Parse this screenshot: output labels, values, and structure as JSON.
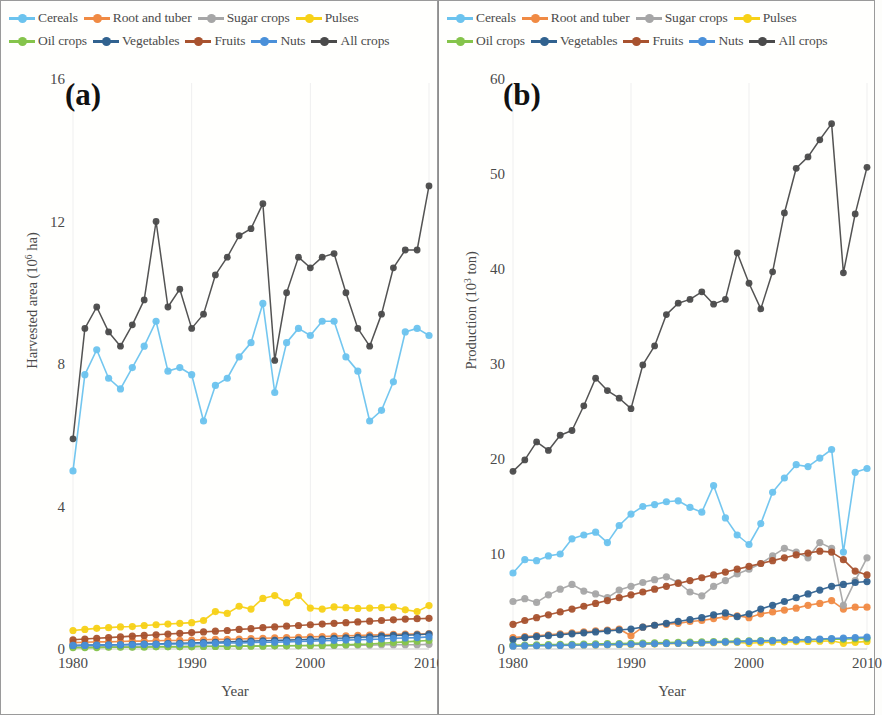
{
  "figure": {
    "panels": [
      {
        "id": "a",
        "letter": "(a)",
        "ylabel_main": "Harvested area (10",
        "ylabel_sup": "6",
        "ylabel_tail": " ha)",
        "xlabel": "Year"
      },
      {
        "id": "b",
        "letter": "(b)",
        "ylabel_main": "Production (10",
        "ylabel_sup": "3",
        "ylabel_tail": " ton)",
        "xlabel": "Year"
      }
    ]
  },
  "legend": {
    "row1": [
      {
        "label": "Cereals",
        "color": "#6cc3ee"
      },
      {
        "label": "Root and tuber",
        "color": "#f08a43"
      },
      {
        "label": "Sugar crops",
        "color": "#a6a6a6"
      },
      {
        "label": "Pulses",
        "color": "#f7d117"
      }
    ],
    "row2": [
      {
        "label": "Oil crops",
        "color": "#85c44b"
      },
      {
        "label": "Vegetables",
        "color": "#31628f"
      },
      {
        "label": "Fruits",
        "color": "#a8522e"
      },
      {
        "label": "Nuts",
        "color": "#4a90d9"
      },
      {
        "label": "All crops",
        "color": "#4a4a4a"
      }
    ]
  },
  "chart_data": [
    {
      "type": "line",
      "panel": "a",
      "title": "(a)",
      "xlabel": "Year",
      "ylabel": "Harvested area (10^6 ha)",
      "xlim": [
        1980,
        2010
      ],
      "ylim": [
        0,
        16
      ],
      "yticks": [
        0,
        4,
        8,
        12,
        16
      ],
      "xticks": [
        1980,
        1990,
        2000,
        2010
      ],
      "grid": false,
      "legend_position": "top",
      "x": [
        1980,
        1981,
        1982,
        1983,
        1984,
        1985,
        1986,
        1987,
        1988,
        1989,
        1990,
        1991,
        1992,
        1993,
        1994,
        1995,
        1996,
        1997,
        1998,
        1999,
        2000,
        2001,
        2002,
        2003,
        2004,
        2005,
        2006,
        2007,
        2008,
        2009,
        2010
      ],
      "series": [
        {
          "name": "Cereals",
          "color": "#6cc3ee",
          "values": [
            5.0,
            7.7,
            8.4,
            7.6,
            7.3,
            7.9,
            8.5,
            9.2,
            7.8,
            7.9,
            7.7,
            6.4,
            7.4,
            7.6,
            8.2,
            8.6,
            9.7,
            7.2,
            8.6,
            9.0,
            8.8,
            9.2,
            9.2,
            8.2,
            7.8,
            6.4,
            6.7,
            7.5,
            8.9,
            9.0,
            8.8,
            9.1,
            11.7,
            5.6,
            10.0,
            10.4
          ]
        },
        {
          "name": "Root and tuber",
          "color": "#f08a43",
          "values": [
            0.18,
            0.19,
            0.2,
            0.2,
            0.21,
            0.22,
            0.22,
            0.23,
            0.24,
            0.24,
            0.25,
            0.26,
            0.27,
            0.27,
            0.28,
            0.29,
            0.3,
            0.31,
            0.32,
            0.33,
            0.34,
            0.35,
            0.36,
            0.37,
            0.38,
            0.39,
            0.4,
            0.41,
            0.42,
            0.42,
            0.43
          ]
        },
        {
          "name": "Sugar crops",
          "color": "#a6a6a6",
          "values": [
            0.05,
            0.05,
            0.06,
            0.06,
            0.06,
            0.06,
            0.07,
            0.07,
            0.07,
            0.07,
            0.08,
            0.08,
            0.08,
            0.08,
            0.08,
            0.09,
            0.09,
            0.09,
            0.09,
            0.1,
            0.1,
            0.1,
            0.1,
            0.11,
            0.11,
            0.11,
            0.12,
            0.12,
            0.12,
            0.12,
            0.13
          ]
        },
        {
          "name": "Pulses",
          "color": "#f7d117",
          "values": [
            0.52,
            0.55,
            0.58,
            0.6,
            0.62,
            0.63,
            0.66,
            0.68,
            0.7,
            0.72,
            0.74,
            0.8,
            1.05,
            1.0,
            1.2,
            1.12,
            1.42,
            1.5,
            1.3,
            1.5,
            1.15,
            1.12,
            1.18,
            1.16,
            1.14,
            1.15,
            1.16,
            1.18,
            1.1,
            1.05,
            1.22
          ]
        },
        {
          "name": "Oil crops",
          "color": "#85c44b",
          "values": [
            0.04,
            0.04,
            0.04,
            0.05,
            0.05,
            0.05,
            0.05,
            0.06,
            0.06,
            0.06,
            0.06,
            0.07,
            0.07,
            0.07,
            0.08,
            0.08,
            0.08,
            0.09,
            0.09,
            0.09,
            0.1,
            0.1,
            0.11,
            0.12,
            0.13,
            0.14,
            0.16,
            0.18,
            0.2,
            0.22,
            0.24
          ]
        },
        {
          "name": "Vegetables",
          "color": "#31628f",
          "values": [
            0.1,
            0.11,
            0.11,
            0.12,
            0.12,
            0.13,
            0.14,
            0.14,
            0.15,
            0.16,
            0.17,
            0.18,
            0.19,
            0.2,
            0.21,
            0.22,
            0.23,
            0.24,
            0.25,
            0.26,
            0.27,
            0.28,
            0.3,
            0.31,
            0.33,
            0.34,
            0.36,
            0.38,
            0.39,
            0.4,
            0.42
          ]
        },
        {
          "name": "Fruits",
          "color": "#a8522e",
          "values": [
            0.26,
            0.28,
            0.3,
            0.32,
            0.34,
            0.36,
            0.38,
            0.4,
            0.42,
            0.44,
            0.46,
            0.48,
            0.5,
            0.52,
            0.55,
            0.57,
            0.6,
            0.62,
            0.64,
            0.66,
            0.68,
            0.7,
            0.72,
            0.74,
            0.76,
            0.78,
            0.8,
            0.82,
            0.84,
            0.85,
            0.86
          ]
        },
        {
          "name": "Nuts",
          "color": "#4a90d9",
          "values": [
            0.1,
            0.1,
            0.11,
            0.11,
            0.12,
            0.12,
            0.13,
            0.13,
            0.14,
            0.14,
            0.15,
            0.15,
            0.16,
            0.17,
            0.17,
            0.18,
            0.19,
            0.19,
            0.2,
            0.21,
            0.22,
            0.23,
            0.24,
            0.25,
            0.26,
            0.27,
            0.28,
            0.3,
            0.31,
            0.32,
            0.34
          ]
        },
        {
          "name": "All crops",
          "color": "#4a4a4a",
          "values": [
            5.9,
            9.0,
            9.6,
            8.9,
            8.5,
            9.1,
            9.8,
            12.0,
            9.6,
            10.1,
            9.0,
            9.4,
            10.5,
            11.0,
            11.6,
            11.8,
            12.5,
            8.1,
            10.0,
            11.0,
            10.7,
            11.0,
            11.1,
            10.0,
            9.0,
            8.5,
            9.4,
            10.7,
            11.2,
            11.2,
            13.0,
            13.7,
            14.8,
            8.8,
            13.2,
            13.7
          ]
        }
      ]
    },
    {
      "type": "line",
      "panel": "b",
      "title": "(b)",
      "xlabel": "Year",
      "ylabel": "Production (10^3 ton)",
      "xlim": [
        1980,
        2010
      ],
      "ylim": [
        0,
        60
      ],
      "yticks": [
        0,
        10,
        20,
        30,
        40,
        50,
        60
      ],
      "xticks": [
        1980,
        1990,
        2000,
        2010
      ],
      "grid": false,
      "legend_position": "top",
      "x": [
        1980,
        1981,
        1982,
        1983,
        1984,
        1985,
        1986,
        1987,
        1988,
        1989,
        1990,
        1991,
        1992,
        1993,
        1994,
        1995,
        1996,
        1997,
        1998,
        1999,
        2000,
        2001,
        2002,
        2003,
        2004,
        2005,
        2006,
        2007,
        2008,
        2009,
        2010
      ],
      "series": [
        {
          "name": "Cereals",
          "color": "#6cc3ee",
          "values": [
            8.0,
            9.4,
            9.3,
            9.8,
            10.0,
            11.6,
            12.0,
            12.3,
            11.2,
            13.0,
            14.2,
            15.0,
            15.2,
            15.5,
            15.6,
            14.9,
            14.4,
            17.2,
            13.8,
            12.0,
            11.0,
            13.2,
            16.5,
            18.0,
            19.4,
            19.2,
            20.1,
            21.0,
            10.2,
            18.6,
            19.0
          ]
        },
        {
          "name": "Root and tuber",
          "color": "#f08a43",
          "values": [
            1.2,
            1.3,
            1.4,
            1.5,
            1.6,
            1.7,
            1.8,
            1.9,
            2.0,
            2.1,
            1.4,
            2.3,
            2.5,
            2.6,
            2.7,
            2.9,
            3.0,
            3.2,
            3.4,
            3.5,
            3.3,
            3.7,
            3.9,
            4.1,
            4.3,
            4.6,
            4.8,
            5.1,
            4.2,
            4.4,
            4.4
          ]
        },
        {
          "name": "Sugar crops",
          "color": "#a6a6a6",
          "values": [
            5.0,
            5.3,
            4.9,
            5.7,
            6.3,
            6.8,
            6.1,
            5.8,
            5.4,
            6.2,
            6.6,
            7.0,
            7.3,
            7.6,
            7.0,
            6.0,
            5.6,
            6.6,
            7.2,
            7.9,
            8.4,
            9.0,
            9.8,
            10.6,
            10.2,
            9.6,
            11.2,
            10.6,
            4.6,
            7.2,
            9.6
          ]
        },
        {
          "name": "Pulses",
          "color": "#f7d117",
          "values": [
            0.35,
            0.36,
            0.37,
            0.38,
            0.4,
            0.41,
            0.42,
            0.43,
            0.45,
            0.46,
            0.48,
            0.5,
            0.52,
            0.55,
            0.58,
            0.6,
            0.63,
            0.66,
            0.68,
            0.7,
            0.6,
            0.68,
            0.72,
            0.75,
            0.78,
            0.8,
            0.82,
            0.86,
            0.6,
            0.7,
            0.8
          ]
        },
        {
          "name": "Oil crops",
          "color": "#85c44b",
          "values": [
            0.4,
            0.42,
            0.44,
            0.46,
            0.48,
            0.5,
            0.52,
            0.54,
            0.56,
            0.58,
            0.6,
            0.62,
            0.64,
            0.67,
            0.7,
            0.72,
            0.75,
            0.78,
            0.8,
            0.83,
            0.86,
            0.88,
            0.9,
            0.92,
            0.95,
            0.98,
            1.0,
            1.05,
            1.02,
            1.08,
            1.1
          ]
        },
        {
          "name": "Vegetables",
          "color": "#31628f",
          "values": [
            1.0,
            1.2,
            1.3,
            1.4,
            1.5,
            1.6,
            1.7,
            1.8,
            1.9,
            2.0,
            2.1,
            2.3,
            2.5,
            2.7,
            2.9,
            3.1,
            3.3,
            3.6,
            3.8,
            3.4,
            3.7,
            4.2,
            4.6,
            5.0,
            5.4,
            5.8,
            6.2,
            6.6,
            6.8,
            7.0,
            7.1
          ]
        },
        {
          "name": "Fruits",
          "color": "#a8522e",
          "values": [
            2.6,
            3.0,
            3.3,
            3.6,
            3.9,
            4.2,
            4.5,
            4.8,
            5.1,
            5.4,
            5.7,
            6.0,
            6.3,
            6.6,
            6.9,
            7.2,
            7.5,
            7.8,
            8.1,
            8.4,
            8.7,
            9.0,
            9.3,
            9.6,
            9.9,
            10.1,
            10.3,
            10.2,
            9.4,
            8.2,
            7.8
          ]
        },
        {
          "name": "Nuts",
          "color": "#4a90d9",
          "values": [
            0.3,
            0.32,
            0.34,
            0.36,
            0.38,
            0.4,
            0.42,
            0.44,
            0.46,
            0.48,
            0.5,
            0.52,
            0.55,
            0.58,
            0.6,
            0.63,
            0.66,
            0.7,
            0.73,
            0.76,
            0.8,
            0.84,
            0.88,
            0.92,
            0.96,
            1.0,
            1.05,
            1.1,
            1.15,
            1.2,
            1.25
          ]
        },
        {
          "name": "All crops",
          "color": "#4a4a4a",
          "values": [
            18.7,
            19.9,
            21.8,
            20.9,
            22.5,
            23.0,
            25.6,
            28.5,
            27.2,
            26.4,
            25.3,
            29.9,
            31.9,
            35.2,
            36.4,
            36.8,
            37.6,
            36.3,
            36.8,
            41.7,
            38.5,
            35.8,
            39.7,
            45.9,
            50.6,
            51.8,
            53.6,
            55.3,
            39.6,
            45.8,
            50.7
          ]
        }
      ]
    }
  ]
}
